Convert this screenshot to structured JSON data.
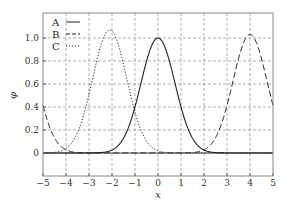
{
  "chart_data": {
    "type": "line",
    "title": "",
    "xlabel": "x",
    "ylabel": "φ",
    "xlim": [
      -5,
      5
    ],
    "ylim": [
      -0.2,
      1.217
    ],
    "grid": true,
    "xticks": [
      -5,
      -4,
      -3,
      -2,
      -1,
      0,
      1,
      2,
      3,
      4,
      5
    ],
    "xtick_labels": [
      "−5",
      "−4",
      "−3",
      "−2",
      "−1",
      "0",
      "1",
      "2",
      "3",
      "4",
      "5"
    ],
    "yticks": [
      0,
      0.2,
      0.4,
      0.6,
      0.8,
      1.0
    ],
    "ytick_labels": [
      "0",
      "0.2",
      "0.4",
      "0.6",
      "0.8",
      "1.0"
    ],
    "legend_position": "top-left",
    "series": [
      {
        "name": "A",
        "style": "solid",
        "center": 0,
        "amplitude": 1.0,
        "sigma": 0.74,
        "sample_x": [
          -5,
          -4,
          -3,
          -2,
          -1,
          0,
          1,
          2,
          3,
          4,
          5
        ],
        "sample_y": [
          0,
          0,
          0,
          0.03,
          0.4,
          1.0,
          0.4,
          0.03,
          0,
          0,
          0
        ]
      },
      {
        "name": "B",
        "style": "dashed",
        "center": 4,
        "amplitude": 1.03,
        "sigma": 0.74,
        "periodic_wrap": 10,
        "sample_x": [
          -5,
          -4,
          -3,
          -2,
          -1,
          0,
          1,
          2,
          3,
          4,
          5
        ],
        "sample_y": [
          0.41,
          0.03,
          0,
          0,
          0,
          0,
          0,
          0.03,
          0.41,
          1.03,
          0.41
        ]
      },
      {
        "name": "C",
        "style": "dotted",
        "center": -2.1,
        "amplitude": 1.07,
        "sigma": 0.74,
        "sample_x": [
          -5,
          -4,
          -3,
          -2,
          -1,
          0,
          1,
          2,
          3,
          4,
          5
        ],
        "sample_y": [
          0,
          0.04,
          0.5,
          1.06,
          0.35,
          0.02,
          0,
          0,
          0,
          0,
          0
        ]
      }
    ]
  }
}
